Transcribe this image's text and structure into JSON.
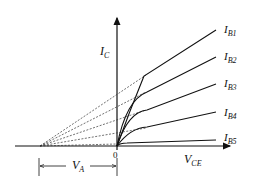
{
  "diagram": {
    "axes": {
      "y_label": "I",
      "y_sub": "C",
      "x_label": "V",
      "x_sub": "CE",
      "origin_label": "0"
    },
    "curves": [
      {
        "label": "I",
        "sub": "B1"
      },
      {
        "label": "I",
        "sub": "B2"
      },
      {
        "label": "I",
        "sub": "B3"
      },
      {
        "label": "I",
        "sub": "B4"
      },
      {
        "label": "I",
        "sub": "B5"
      }
    ],
    "early_voltage": {
      "label": "V",
      "sub": "A"
    },
    "colors": {
      "line": "#111111",
      "dashed": "#333333"
    }
  }
}
